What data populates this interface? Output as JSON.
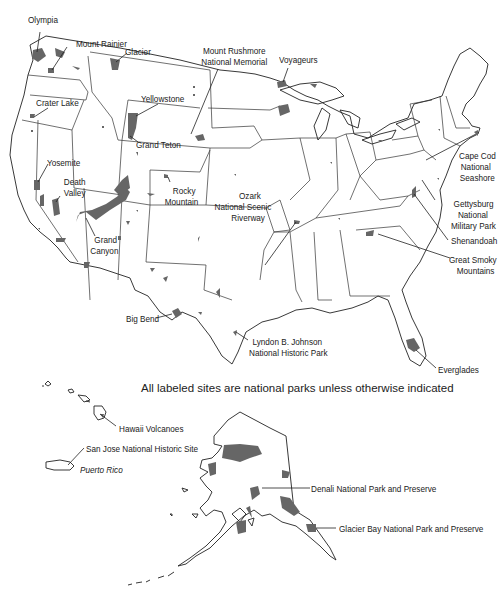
{
  "map": {
    "title_note": "All labeled sites are national parks unless otherwise indicated",
    "colors": {
      "park_fill": "#666666",
      "outline": "#222222",
      "background": "#ffffff"
    },
    "regions": [
      "Contiguous United States",
      "Alaska",
      "Hawaii",
      "Puerto Rico"
    ],
    "labels": {
      "olympia": "Olympia",
      "mount_rainier": "Mount Rainier",
      "glacier": "Glacier",
      "mount_rushmore_1": "Mount Rushmore",
      "mount_rushmore_2": "National Memorial",
      "voyageurs": "Voyageurs",
      "crater_lake": "Crater Lake",
      "yellowstone": "Yellowstone",
      "grand_teton": "Grand Teton",
      "yosemite": "Yosemite",
      "death_valley_1": "Death",
      "death_valley_2": "Valley",
      "rocky_mountain_1": "Rocky",
      "rocky_mountain_2": "Mountain",
      "grand_canyon_1": "Grand",
      "grand_canyon_2": "Canyon",
      "ozark_1": "Ozark",
      "ozark_2": "National Scenic",
      "ozark_3": "Riverway",
      "cape_cod_1": "Cape Cod",
      "cape_cod_2": "National",
      "cape_cod_3": "Seashore",
      "gettysburg_1": "Gettysburg",
      "gettysburg_2": "National",
      "gettysburg_3": "Military Park",
      "shenandoah": "Shenandoah",
      "great_smoky_1": "Great Smoky",
      "great_smoky_2": "Mountains",
      "big_bend": "Big Bend",
      "lbj_1": "Lyndon B. Johnson",
      "lbj_2": "National Historic Park",
      "everglades": "Everglades",
      "hawaii_volcanoes": "Hawaii Volcanoes",
      "san_jose": "San Jose National Historic Site",
      "puerto_rico": "Puerto Rico",
      "denali": "Denali National Park and Preserve",
      "glacier_bay": "Glacier Bay National Park and Preserve"
    }
  }
}
